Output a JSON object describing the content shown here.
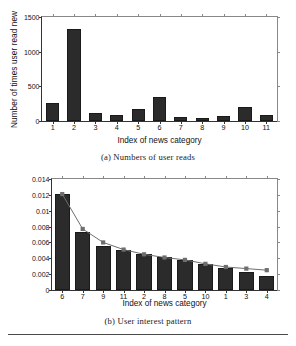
{
  "figure_a": {
    "caption": "(a)  Numbers of user reads",
    "chart_data": {
      "type": "bar",
      "title": "",
      "xlabel": "Index of news category",
      "ylabel": "Number of times user read new",
      "categories": [
        "1",
        "2",
        "3",
        "4",
        "5",
        "6",
        "7",
        "8",
        "9",
        "10",
        "11"
      ],
      "values": [
        253,
        1320,
        120,
        92,
        180,
        340,
        52,
        50,
        78,
        196,
        92
      ],
      "ylim": [
        0,
        1500
      ],
      "yticks": [
        0,
        500,
        1000,
        1500
      ],
      "ytick_labels": [
        "0",
        "500",
        "1000",
        "1500"
      ],
      "grid": false,
      "legend": "none",
      "bar_color": "#2b2b2b"
    }
  },
  "figure_b": {
    "caption": "(b)  User interest pattern",
    "chart_data": {
      "type": "bar",
      "title": "",
      "xlabel": "Index of news category",
      "ylabel": "Ratio",
      "categories": [
        "6",
        "7",
        "9",
        "11",
        "2",
        "8",
        "5",
        "10",
        "1",
        "3",
        "4"
      ],
      "values": [
        0.0121,
        0.0073,
        0.0056,
        0.0051,
        0.0046,
        0.0041,
        0.0038,
        0.0033,
        0.0028,
        0.0023,
        0.0018
      ],
      "series": [
        {
          "name": "bars",
          "type": "bar",
          "values": [
            0.0121,
            0.0073,
            0.0056,
            0.0051,
            0.0046,
            0.0041,
            0.0038,
            0.0033,
            0.0028,
            0.0023,
            0.0018
          ]
        },
        {
          "name": "markers",
          "type": "line",
          "marker": "square",
          "color": "#6e6e6e",
          "values": [
            0.0121,
            0.0077,
            0.006,
            0.0051,
            0.0045,
            0.0041,
            0.0038,
            0.0033,
            0.0029,
            0.0027,
            0.0025
          ]
        }
      ],
      "ylim": [
        0,
        0.014
      ],
      "yticks": [
        0,
        0.002,
        0.004,
        0.006,
        0.008,
        0.01,
        0.012,
        0.014
      ],
      "ytick_labels": [
        "0",
        "0.002",
        "0.004",
        "0.006",
        "0.008",
        "0.01",
        "0.012",
        "0.014"
      ],
      "grid": false,
      "legend": "none",
      "bar_color": "#2b2b2b"
    }
  }
}
